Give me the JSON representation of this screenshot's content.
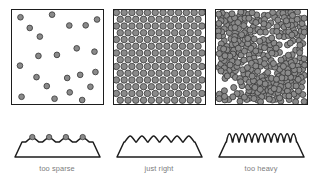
{
  "figure": {
    "type": "diagram",
    "colors": {
      "outline": "#1d1d1d",
      "circle_fill": "#8a8a8a",
      "circle_stroke": "#3a3a3a",
      "caption_text": "#7c7c7c",
      "background": "#ffffff"
    }
  },
  "panels": [
    {
      "id": "too-sparse",
      "caption": "too sparse",
      "density_label": "sparse",
      "grain_count": 22,
      "grain_radius": 2.9,
      "packing": "random-scattered",
      "profile": {
        "bump_count": 4,
        "bump_width": 13,
        "bump_height": 6,
        "bump_style": "wide-rounded",
        "grains_on_peaks": true
      }
    },
    {
      "id": "just-right",
      "caption": "just right",
      "density_label": "optimal",
      "grain_count": 210,
      "grain_radius": 3.3,
      "packing": "hexagonal-close-packed",
      "profile": {
        "bump_count": 6,
        "bump_width": 11,
        "bump_height": 8,
        "bump_style": "rounded",
        "grains_on_peaks": false
      }
    },
    {
      "id": "too-heavy",
      "caption": "too heavy",
      "density_label": "overcrowded",
      "grain_count": 330,
      "grain_radius": 3.1,
      "packing": "random-overlapping-clustered",
      "profile": {
        "bump_count": 11,
        "bump_width": 6,
        "bump_height": 11,
        "bump_style": "narrow-tall-spike",
        "grains_on_peaks": false
      }
    }
  ]
}
